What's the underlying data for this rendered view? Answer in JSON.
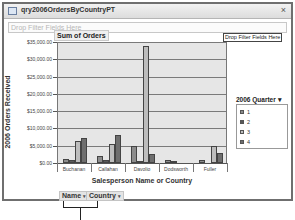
{
  "window": {
    "title": "qry2006OrdersByCountryPT",
    "close_label": "×"
  },
  "filter_zone": {
    "placeholder": "Drop Filter Fields Here"
  },
  "chart_header": {
    "data_field": "Sum of Orders",
    "drop_filter_button": "Drop Filter Fields Here"
  },
  "legend": {
    "title": "2006 Quarter",
    "dropdown_arrow": "▾",
    "items": [
      {
        "label": "1",
        "color": "#8c8c8c"
      },
      {
        "label": "2",
        "color": "#5a5a5a"
      },
      {
        "label": "3",
        "color": "#bdbdbd"
      },
      {
        "label": "4",
        "color": "#6e6e6e"
      }
    ]
  },
  "axis_fields": {
    "name": "Name",
    "country": "Country",
    "arrow": "▾"
  },
  "chart_data": {
    "type": "bar",
    "title": "Sum of Orders",
    "xlabel": "Salesperson Name or Country",
    "ylabel": "2006 Orders Received",
    "ylim": [
      0,
      35000
    ],
    "y_ticks": [
      "$35,000.00",
      "$30,000.00",
      "$25,000.00",
      "$20,000.00",
      "$15,000.00",
      "$10,000.00",
      "$5,000.00",
      "$0.00"
    ],
    "categories": [
      "Buchanan",
      "Callahan",
      "Davolio",
      "Dodsworth",
      "Fuller"
    ],
    "legend_title": "2006 Quarter",
    "legend_position": "right",
    "grid": true,
    "series": [
      {
        "name": "1",
        "values": [
          1300,
          2000,
          5000,
          900,
          1000
        ]
      },
      {
        "name": "2",
        "values": [
          900,
          1000,
          300,
          500,
          0
        ]
      },
      {
        "name": "3",
        "values": [
          6500,
          5400,
          33900,
          0,
          4900
        ]
      },
      {
        "name": "4",
        "values": [
          7100,
          8000,
          2600,
          0,
          2900
        ]
      }
    ]
  }
}
